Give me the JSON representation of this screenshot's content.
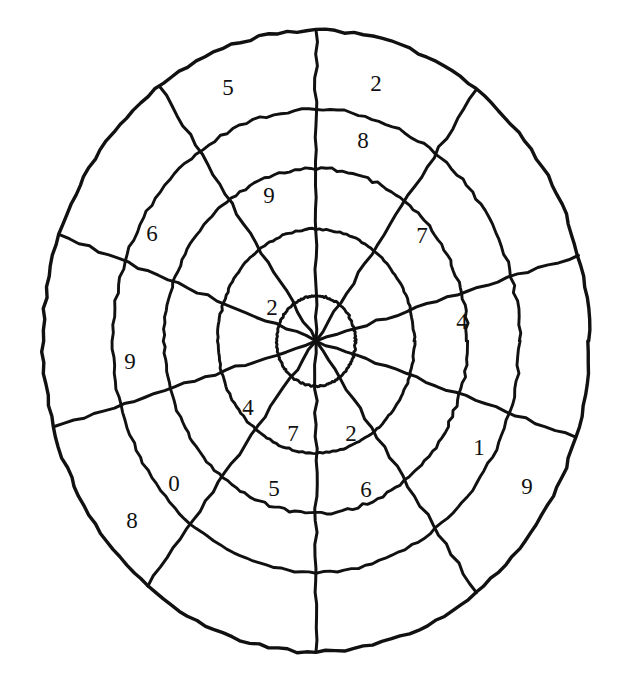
{
  "figure": {
    "name": "radial-number-wheel",
    "background_color": "#ffffff",
    "stroke_color": "#111111"
  },
  "geometry": {
    "center_x": 316,
    "center_y": 341,
    "radius_x": 273,
    "radius_y": 311,
    "ring_count": 5,
    "spoke_count": 10,
    "ring_radius_fractions": [
      0.145,
      0.36,
      0.555,
      0.745,
      1.0
    ],
    "spoke_angles_deg": [
      90,
      125,
      160,
      196,
      232,
      270,
      306,
      342,
      16,
      54
    ]
  },
  "chart_data": {
    "type": "pie",
    "title": "",
    "xlabel": "",
    "ylabel": "",
    "legend": [],
    "rings": [
      "ring-1-center",
      "ring-2",
      "ring-3",
      "ring-4",
      "ring-5-outer"
    ],
    "labels": [
      {
        "id": "label-ring5-upper-left",
        "value": "5",
        "ring": 5,
        "x": 228,
        "y": 90
      },
      {
        "id": "label-ring5-upper-right",
        "value": "2",
        "ring": 5,
        "x": 376,
        "y": 86
      },
      {
        "id": "label-ring4-upper-right",
        "value": "8",
        "ring": 4,
        "x": 363,
        "y": 143
      },
      {
        "id": "label-ring3-upper",
        "value": "9",
        "ring": 3,
        "x": 269,
        "y": 198
      },
      {
        "id": "label-ring4-left",
        "value": "6",
        "ring": 4,
        "x": 152,
        "y": 236
      },
      {
        "id": "label-ring3-right",
        "value": "7",
        "ring": 3,
        "x": 422,
        "y": 238
      },
      {
        "id": "label-ring2-upper-left",
        "value": "2",
        "ring": 2,
        "x": 272,
        "y": 310
      },
      {
        "id": "label-ring3-far-right",
        "value": "4",
        "ring": 3,
        "x": 462,
        "y": 324
      },
      {
        "id": "label-ring4-far-left",
        "value": "9",
        "ring": 4,
        "x": 130,
        "y": 364
      },
      {
        "id": "label-ring2-lower-left",
        "value": "4",
        "ring": 2,
        "x": 248,
        "y": 410
      },
      {
        "id": "label-ring2-lower",
        "value": "7",
        "ring": 2,
        "x": 293,
        "y": 436
      },
      {
        "id": "label-ring2-lower-right",
        "value": "2",
        "ring": 2,
        "x": 351,
        "y": 436
      },
      {
        "id": "label-ring4-lower-right",
        "value": "1",
        "ring": 4,
        "x": 479,
        "y": 450
      },
      {
        "id": "label-ring4-lower-left",
        "value": "0",
        "ring": 4,
        "x": 174,
        "y": 486
      },
      {
        "id": "label-ring3-lower",
        "value": "5",
        "ring": 3,
        "x": 274,
        "y": 491
      },
      {
        "id": "label-ring3-lower-right",
        "value": "6",
        "ring": 3,
        "x": 366,
        "y": 492
      },
      {
        "id": "label-ring5-lower-right",
        "value": "9",
        "ring": 5,
        "x": 527,
        "y": 489
      },
      {
        "id": "label-ring5-lower-left",
        "value": "8",
        "ring": 5,
        "x": 132,
        "y": 523
      }
    ],
    "values": [
      5,
      2,
      8,
      9,
      6,
      7,
      2,
      4,
      9,
      4,
      7,
      2,
      1,
      0,
      5,
      6,
      9,
      8
    ],
    "categories": [
      "ring5-upper-left",
      "ring5-upper-right",
      "ring4-upper-right",
      "ring3-upper",
      "ring4-left",
      "ring3-right",
      "ring2-upper-left",
      "ring3-far-right",
      "ring4-far-left",
      "ring2-lower-left",
      "ring2-lower",
      "ring2-lower-right",
      "ring4-lower-right",
      "ring4-lower-left",
      "ring3-lower",
      "ring3-lower-right",
      "ring5-lower-right",
      "ring5-lower-left"
    ]
  }
}
